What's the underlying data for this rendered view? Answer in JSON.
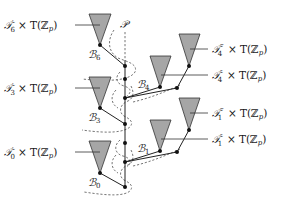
{
  "diagram": {
    "spine_label": "𝒫",
    "colors": {
      "triangle_fill": "#a6a6a6",
      "triangle_stroke": "#333333",
      "line": "#222222",
      "dash": "#666666",
      "dot": "#111111",
      "text": "#1a1a1a"
    },
    "left_labels": [
      {
        "name": "T6-prime",
        "tree": "𝒯",
        "sub": "6",
        "prime": "′",
        "times": "×",
        "factor": "T(ℤ",
        "factor_sub": "p",
        "close": ")"
      },
      {
        "name": "T3-prime",
        "tree": "𝒯",
        "sub": "3",
        "prime": "′",
        "times": "×",
        "factor": "T(ℤ",
        "factor_sub": "p",
        "close": ")"
      },
      {
        "name": "T0-prime",
        "tree": "𝒯",
        "sub": "0",
        "prime": "′",
        "times": "×",
        "factor": "T(ℤ",
        "factor_sub": "p",
        "close": ")"
      }
    ],
    "right_labels": [
      {
        "name": "T4-triple-prime",
        "tree": "𝒯",
        "sub": "4",
        "prime": "‴",
        "times": "×",
        "factor": "T(ℤ",
        "factor_sub": "p",
        "close": ")"
      },
      {
        "name": "T4-double-prime",
        "tree": "𝒯",
        "sub": "4",
        "prime": "″",
        "times": "×",
        "factor": "T(ℤ",
        "factor_sub": "p",
        "close": ")"
      },
      {
        "name": "T1-triple-prime",
        "tree": "𝒯",
        "sub": "1",
        "prime": "‴",
        "times": "×",
        "factor": "T(ℤ",
        "factor_sub": "p",
        "close": ")"
      },
      {
        "name": "T1-double-prime",
        "tree": "𝒯",
        "sub": "1",
        "prime": "″",
        "times": "×",
        "factor": "T(ℤ",
        "factor_sub": "p",
        "close": ")"
      }
    ],
    "branch_labels": [
      {
        "name": "B6",
        "letter": "ℬ",
        "sub": "6"
      },
      {
        "name": "B3",
        "letter": "ℬ",
        "sub": "3"
      },
      {
        "name": "B0",
        "letter": "ℬ",
        "sub": "0"
      },
      {
        "name": "B4",
        "letter": "ℬ",
        "sub": "4"
      },
      {
        "name": "B1",
        "letter": "ℬ",
        "sub": "1"
      }
    ]
  }
}
